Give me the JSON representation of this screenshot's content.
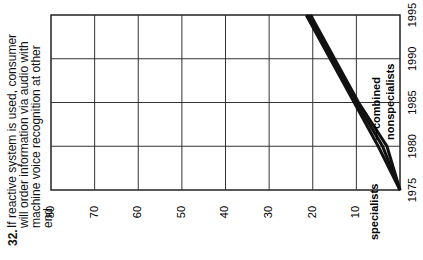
{
  "chart_data": {
    "type": "line",
    "orientation": "rotated-90",
    "title_number": "32.",
    "title": "If reactive system is used, consumer will order information via audio with machine voice recognition at other end",
    "xlabel": "",
    "ylabel": "",
    "value_axis": {
      "ticks": [
        "80",
        "70",
        "60",
        "50",
        "40",
        "30",
        "20",
        "10"
      ],
      "range": [
        0,
        80
      ]
    },
    "year_axis": {
      "ticks": [
        "1975",
        "1980",
        "1985",
        "1990",
        "1995"
      ],
      "range": [
        1975,
        1995
      ]
    },
    "grid": true,
    "x": [
      1975,
      1980,
      1985,
      1990,
      1995
    ],
    "series": [
      {
        "name": "specialists",
        "values": [
          0,
          5,
          10.5,
          16,
          21.5
        ]
      },
      {
        "name": "combined",
        "values": [
          0,
          4,
          10,
          15.5,
          21
        ]
      },
      {
        "name": "nonspecialists",
        "values": [
          0,
          3,
          9.5,
          15,
          20.5
        ]
      }
    ],
    "labels": {
      "specialists": "specialists",
      "combined": "combined",
      "nonspecialists": "nonspecialists"
    }
  }
}
